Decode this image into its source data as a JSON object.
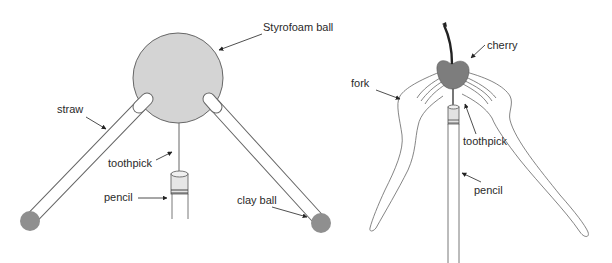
{
  "left_diagram": {
    "labels": {
      "styrofoam_ball": "Styrofoam ball",
      "straw": "straw",
      "toothpick": "toothpick",
      "pencil": "pencil",
      "clay_ball": "clay ball"
    }
  },
  "right_diagram": {
    "labels": {
      "cherry": "cherry",
      "fork": "fork",
      "toothpick": "toothpick",
      "pencil": "pencil"
    }
  },
  "colors": {
    "styrofoam_fill": "#d4d4d4",
    "clay_fill": "#8f8f8f",
    "cherry_fill": "#7d7d7d",
    "stem": "#222222",
    "line": "#555555"
  }
}
